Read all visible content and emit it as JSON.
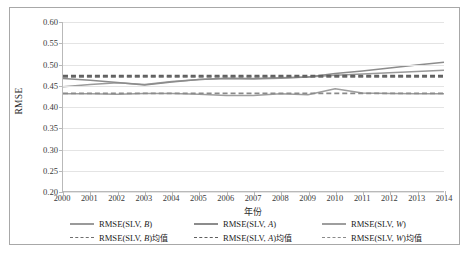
{
  "chart_data": {
    "type": "line",
    "title": "",
    "xlabel": "年份",
    "ylabel": "RMSE",
    "x": [
      2000,
      2001,
      2002,
      2003,
      2004,
      2005,
      2006,
      2007,
      2008,
      2009,
      2010,
      2011,
      2012,
      2013,
      2014
    ],
    "categories": [
      "2000",
      "2001",
      "2002",
      "2003",
      "2004",
      "2005",
      "2006",
      "2007",
      "2008",
      "2009",
      "2010",
      "2011",
      "2012",
      "2013",
      "2014"
    ],
    "ylim": [
      0.2,
      0.6
    ],
    "ytick_values": [
      0.2,
      0.25,
      0.3,
      0.35,
      0.4,
      0.45,
      0.5,
      0.55,
      0.6
    ],
    "ytick_labels": [
      "0.20",
      "0.25",
      "0.30",
      "0.35",
      "0.40",
      "0.45",
      "0.50",
      "0.55",
      "0.60"
    ],
    "grid": true,
    "legend_position": "bottom",
    "series": [
      {
        "name": "RMSE(SLV, B)",
        "style": "solid",
        "color": "#9a9a9a",
        "values": [
          0.447,
          0.452,
          0.456,
          0.452,
          0.459,
          0.464,
          0.466,
          0.465,
          0.467,
          0.47,
          0.474,
          0.477,
          0.48,
          0.483,
          0.486
        ]
      },
      {
        "name": "RMSE(SLV, A)",
        "style": "solid",
        "color": "#8c8c8c",
        "values": [
          0.466,
          0.462,
          0.457,
          0.451,
          0.458,
          0.464,
          0.467,
          0.466,
          0.468,
          0.47,
          0.478,
          0.484,
          0.491,
          0.498,
          0.505
        ]
      },
      {
        "name": "RMSE(SLV, W)",
        "style": "solid",
        "color": "#9e9e9e",
        "values": [
          0.43,
          0.43,
          0.429,
          0.431,
          0.431,
          0.429,
          0.426,
          0.426,
          0.43,
          0.428,
          0.442,
          0.432,
          0.431,
          0.43,
          0.43
        ]
      },
      {
        "name": "RMSE(SLV, B)均值",
        "style": "dashed",
        "color": "#6f6f6f",
        "values": [
          0.47,
          0.47,
          0.47,
          0.47,
          0.47,
          0.47,
          0.47,
          0.47,
          0.47,
          0.47,
          0.47,
          0.47,
          0.47,
          0.47,
          0.47
        ]
      },
      {
        "name": "RMSE(SLV, A)均值",
        "style": "dashed",
        "color": "#5f5f5f",
        "values": [
          0.473,
          0.473,
          0.473,
          0.473,
          0.473,
          0.473,
          0.473,
          0.473,
          0.473,
          0.473,
          0.473,
          0.473,
          0.473,
          0.473,
          0.473
        ]
      },
      {
        "name": "RMSE(SLV, W)均值",
        "style": "dashed",
        "color": "#8a8a8a",
        "values": [
          0.431,
          0.431,
          0.431,
          0.431,
          0.431,
          0.431,
          0.431,
          0.431,
          0.431,
          0.431,
          0.431,
          0.431,
          0.431,
          0.431,
          0.431
        ]
      }
    ]
  },
  "legend": {
    "items": [
      {
        "label_prefix": "RMSE(SLV, ",
        "label_italic": "B",
        "label_suffix": ")",
        "style": "solid",
        "color": "#9a9a9a"
      },
      {
        "label_prefix": "RMSE(SLV, ",
        "label_italic": "A",
        "label_suffix": ")",
        "style": "solid",
        "color": "#8c8c8c"
      },
      {
        "label_prefix": "RMSE(SLV, ",
        "label_italic": "W",
        "label_suffix": ")",
        "style": "solid",
        "color": "#9e9e9e"
      },
      {
        "label_prefix": "RMSE(SLV, ",
        "label_italic": "B",
        "label_suffix": ")均值",
        "style": "dashed",
        "color": "#6f6f6f"
      },
      {
        "label_prefix": "RMSE(SLV, ",
        "label_italic": "A",
        "label_suffix": ")均值",
        "style": "dashed",
        "color": "#5f5f5f"
      },
      {
        "label_prefix": "RMSE(SLV, ",
        "label_italic": "W",
        "label_suffix": ")均值",
        "style": "dashed",
        "color": "#8a8a8a"
      }
    ]
  }
}
